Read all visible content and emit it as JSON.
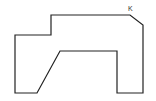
{
  "diagram": {
    "type": "polygon-outline",
    "stroke_color": "#222222",
    "background": "#ffffff",
    "vertices": [
      [
        51,
        15
      ],
      [
        130,
        15
      ],
      [
        143,
        25
      ],
      [
        143,
        93
      ],
      [
        117,
        93
      ],
      [
        117,
        51
      ],
      [
        60,
        51
      ],
      [
        37,
        93
      ],
      [
        15,
        93
      ],
      [
        15,
        35
      ],
      [
        51,
        35
      ]
    ],
    "labels": [
      {
        "text": "K",
        "x": 128,
        "y": 11
      }
    ]
  }
}
